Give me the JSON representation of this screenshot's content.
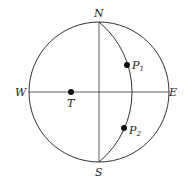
{
  "diagram": {
    "type": "celestial-sphere",
    "labels": {
      "north": "N",
      "south": "S",
      "west": "W",
      "east": "E",
      "point_t": "T",
      "point_p1": "P",
      "point_p1_sub": "1",
      "point_p2": "P",
      "point_p2_sub": "2"
    },
    "colors": {
      "stroke": "#333333",
      "text": "#222222"
    }
  }
}
